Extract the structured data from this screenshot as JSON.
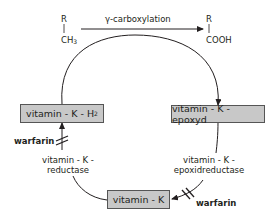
{
  "reaction": {
    "substrate_group": "R",
    "substrate_moiety": "CH",
    "substrate_sub": "3",
    "label": "γ-carboxylation",
    "product_group": "R",
    "product_moiety": "COOH"
  },
  "nodes": {
    "hydroquinone": {
      "label": "vitamin - K - H",
      "sub": "2"
    },
    "epoxide": {
      "label": "vitamin - K - epoxyd"
    },
    "vitamin_k": {
      "label": "vitamin - K"
    }
  },
  "enzymes": {
    "reductase": {
      "line1": "vitamin - K -",
      "line2": "reductase"
    },
    "epoxide_reductase": {
      "line1": "vitamin - K -",
      "line2": "epoxidreductase"
    }
  },
  "inhibitors": {
    "left": "warfarin",
    "right": "warfarin"
  },
  "colors": {
    "box_fill": "#c8c8c8",
    "line": "#231f20"
  }
}
